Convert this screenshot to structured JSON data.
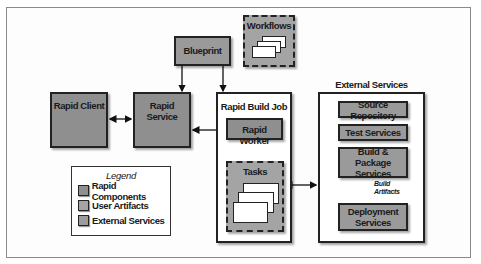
{
  "diagram": {
    "nodes": {
      "blueprint": {
        "label": "Blueprint",
        "type": "user-artifact"
      },
      "workflows": {
        "label": "Workflows",
        "type": "user-artifact"
      },
      "rapid_client": {
        "label": "Rapid Client",
        "type": "rapid-component"
      },
      "rapid_service": {
        "label": "Rapid Service",
        "type": "rapid-component"
      },
      "rapid_build_job": {
        "label": "Rapid Build Job",
        "type": "container"
      },
      "rapid_worker": {
        "label": "Rapid Worker",
        "type": "rapid-component"
      },
      "tasks": {
        "label": "Tasks",
        "type": "user-artifact"
      },
      "external_services": {
        "label": "External Services",
        "type": "container"
      },
      "source_repository": {
        "label": "Source Repository",
        "type": "external-service"
      },
      "test_services": {
        "label": "Test Services",
        "type": "external-service"
      },
      "build_package_services": {
        "label_line1": "Build & Package",
        "label_line2": "Services",
        "type": "external-service"
      },
      "deployment_services": {
        "label_line1": "Deployment",
        "label_line2": "Services",
        "type": "external-service"
      }
    },
    "edges": [
      {
        "from": "Blueprint",
        "to": "Rapid Service",
        "style": "arrow"
      },
      {
        "from": "Blueprint",
        "to": "Rapid Build Job",
        "style": "arrow"
      },
      {
        "from": "Rapid Client",
        "to": "Rapid Service",
        "style": "bidirectional"
      },
      {
        "from": "Rapid Service",
        "to": "Rapid Worker",
        "style": "bidirectional"
      },
      {
        "from": "Rapid Worker",
        "to": "Tasks",
        "style": "arrow"
      },
      {
        "from": "Tasks",
        "to": "External Services",
        "style": "bidirectional"
      },
      {
        "from": "Build & Package Services",
        "to": "Deployment Services",
        "style": "arrow",
        "label": "Build Artifacts"
      }
    ],
    "edge_labels": {
      "build_artifacts_line1": "Build",
      "build_artifacts_line2": "Artifacts"
    },
    "legend": {
      "title": "Legend",
      "items": [
        {
          "label": "Rapid Components",
          "color": "#8f8f8f"
        },
        {
          "label": "User Artifacts",
          "color": "#a4a4a4"
        },
        {
          "label": "External Services",
          "color": "#9c9c9c"
        }
      ]
    }
  }
}
